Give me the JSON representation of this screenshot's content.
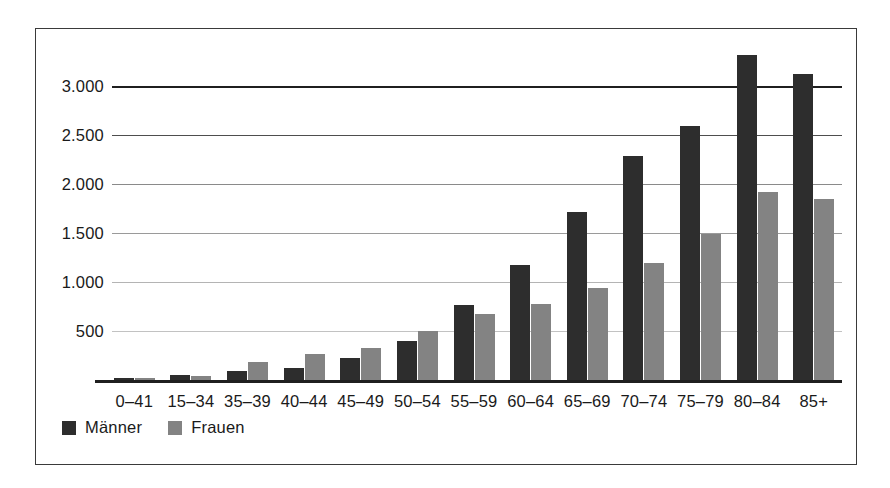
{
  "chart_data": {
    "type": "bar",
    "title": "",
    "subtitle": "",
    "xlabel": "",
    "ylabel": "",
    "grid": true,
    "legend_position": "bottom-left",
    "ylim": [
      0,
      3500
    ],
    "ytick_labels": [
      "3.000",
      "2.500",
      "2.000",
      "1.500",
      "1.000",
      "500"
    ],
    "ytick_values": [
      3000,
      2500,
      2000,
      1500,
      1000,
      500
    ],
    "categories": [
      "0–41",
      "15–34",
      "35–39",
      "40–44",
      "45–49",
      "50–54",
      "55–59",
      "60–64",
      "65–69",
      "70–74",
      "75–79",
      "80–84",
      "85+"
    ],
    "series": [
      {
        "name": "Männer",
        "color": "#2d2d2d",
        "values": [
          20,
          55,
          90,
          125,
          225,
          400,
          765,
          1170,
          1715,
          2290,
          2590,
          3320,
          3120
        ]
      },
      {
        "name": "Frauen",
        "color": "#838383",
        "values": [
          15,
          45,
          185,
          270,
          330,
          495,
          675,
          775,
          940,
          1190,
          1490,
          1920,
          1850
        ]
      }
    ]
  },
  "legend": {
    "items": [
      {
        "label": "Männer",
        "swatch": "male-swatch-icon"
      },
      {
        "label": "Frauen",
        "swatch": "female-swatch-icon"
      }
    ]
  }
}
